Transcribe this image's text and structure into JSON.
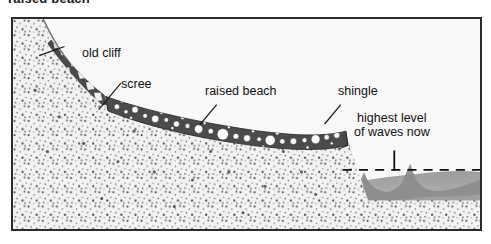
{
  "caption": {
    "text": "raised beach"
  },
  "figure": {
    "frame": {
      "x": 11,
      "y": 17,
      "width": 467,
      "height": 210,
      "border_color": "#2b2b2b",
      "background": "#ffffff"
    },
    "labels": [
      {
        "id": "old-cliff",
        "text": "old cliff",
        "x": 69,
        "y": 35,
        "leader": [
          [
            62,
            44
          ],
          [
            37,
            53
          ]
        ]
      },
      {
        "id": "scree",
        "text": "scree",
        "x": 115,
        "y": 66,
        "leader": [
          [
            118,
            80
          ],
          [
            96,
            106
          ]
        ]
      },
      {
        "id": "raised-beach",
        "text": "raised beach",
        "x": 206,
        "y": 88,
        "leader": [
          [
            213,
            101
          ],
          [
            196,
            121
          ]
        ]
      },
      {
        "id": "shingle",
        "text": "shingle",
        "x": 335,
        "y": 88,
        "leader": [
          [
            336,
            101
          ],
          [
            320,
            120
          ]
        ]
      },
      {
        "id": "highest-level",
        "line1": "highest level",
        "line2": "of waves now",
        "x": 352,
        "y": 113
      }
    ],
    "sea_level": {
      "id": "highest-wave-level",
      "style": "dashed",
      "y": 165,
      "x_start": 338,
      "x_end": 476,
      "tick": {
        "x": 389,
        "y_top": 146,
        "y_bottom": 166
      }
    },
    "colors": {
      "rock_stipple_dark": "#3a3a3a",
      "rock_base": "#f2f2f2",
      "beach_band": "#4a4a4a",
      "pebble": "#ffffff",
      "sea": "#a9a9a9",
      "wave_dark": "#8f8f8f",
      "sky": "#f7f7f7",
      "leader_line": "#1a1a1a",
      "dash_line": "#111111"
    },
    "elements": [
      {
        "id": "old-cliff-slope",
        "kind": "curve",
        "note": "concave former cliff face, upper-left to mid-centre"
      },
      {
        "id": "scree-wedge",
        "kind": "wedge",
        "note": "angular fragments banked against old cliff foot"
      },
      {
        "id": "raised-beach-band",
        "kind": "band",
        "note": "dark band with rounded white pebbles, gently dipping right"
      },
      {
        "id": "shingle-edge",
        "kind": "edge",
        "note": "seaward termination of the beach deposit"
      },
      {
        "id": "rock-platform",
        "kind": "mass",
        "note": "stippled solid rock forming cliff and platform"
      },
      {
        "id": "sea",
        "kind": "water",
        "note": "grey sea with breaking waves at lower right"
      }
    ]
  }
}
